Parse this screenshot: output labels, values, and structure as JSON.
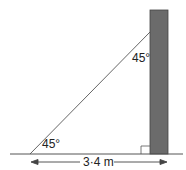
{
  "diagram": {
    "angle_bottom": "45°",
    "angle_top": "45°",
    "base_length": "3·4 m",
    "colors": {
      "wall": "#6b6b6b",
      "line": "#555555"
    }
  }
}
